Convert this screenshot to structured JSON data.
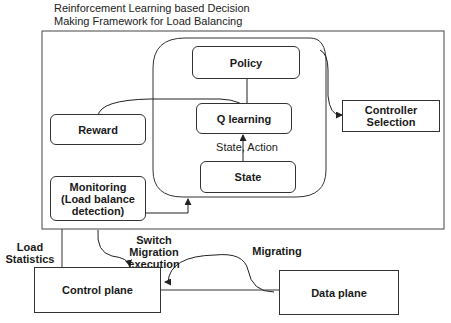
{
  "title": {
    "line1": "Reinforcement Learning based Decision",
    "line2": "Making Framework for Load Balancing"
  },
  "nodes": {
    "policy": "Policy",
    "q_learning": "Q learning",
    "state": "State",
    "reward": "Reward",
    "monitoring": {
      "line1": "Monitoring",
      "line2": "(Load balance",
      "line3": "detection)"
    },
    "controller_selection": {
      "line1": "Controller",
      "line2": "Selection"
    },
    "control_plane": "Control plane",
    "data_plane": "Data plane"
  },
  "edge_labels": {
    "state_action": "State, Action",
    "load_statistics": {
      "line1": "Load",
      "line2": "Statistics"
    },
    "switch_migration": {
      "line1": "Switch",
      "line2": "Migration",
      "line3": "execution"
    },
    "migrating": "Migrating"
  },
  "colors": {
    "stroke": "#333333",
    "text": "#1a1a1a",
    "background": "#ffffff"
  }
}
